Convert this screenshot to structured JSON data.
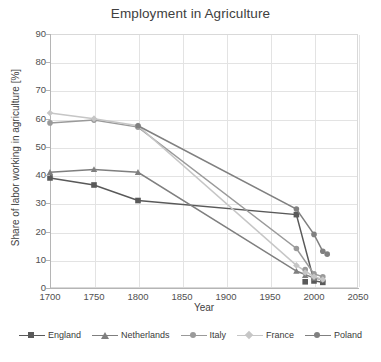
{
  "chart_data": {
    "type": "line",
    "title": "Employment in Agriculture",
    "xlabel": "Year",
    "ylabel": "Share of labor working in agriculture [%]",
    "xlim": [
      1700,
      2050
    ],
    "ylim": [
      0,
      90
    ],
    "xticks": [
      1700,
      1750,
      1800,
      1850,
      1900,
      1950,
      2000,
      2050
    ],
    "yticks": [
      0,
      10,
      20,
      30,
      40,
      50,
      60,
      70,
      80,
      90
    ],
    "grid": true,
    "legend_position": "bottom",
    "series": [
      {
        "name": "England",
        "color": "#595959",
        "marker": "square",
        "points": [
          {
            "x": 1700,
            "y": 39
          },
          {
            "x": 1750,
            "y": 36.5
          },
          {
            "x": 1800,
            "y": 31
          },
          {
            "x": 1980,
            "y": 26
          },
          {
            "x": 2000,
            "y": 2.5
          },
          {
            "x": 2010,
            "y": 2
          }
        ]
      },
      {
        "name": "Netherlands",
        "color": "#7f7f7f",
        "marker": "triangle",
        "points": [
          {
            "x": 1700,
            "y": 41
          },
          {
            "x": 1750,
            "y": 42
          },
          {
            "x": 1800,
            "y": 41
          },
          {
            "x": 1980,
            "y": 6
          },
          {
            "x": 2000,
            "y": 3.5
          },
          {
            "x": 2010,
            "y": 3
          }
        ]
      },
      {
        "name": "Italy",
        "color": "#9a9a9a",
        "marker": "circle",
        "points": [
          {
            "x": 1700,
            "y": 58.5
          },
          {
            "x": 1750,
            "y": 59.5
          },
          {
            "x": 1800,
            "y": 57
          },
          {
            "x": 1980,
            "y": 14
          },
          {
            "x": 2000,
            "y": 5
          },
          {
            "x": 2010,
            "y": 4
          }
        ]
      },
      {
        "name": "France",
        "color": "#c6c6c6",
        "marker": "diamond",
        "points": [
          {
            "x": 1700,
            "y": 62
          },
          {
            "x": 1750,
            "y": 60
          },
          {
            "x": 1800,
            "y": 57.5
          },
          {
            "x": 1980,
            "y": 8
          },
          {
            "x": 2000,
            "y": 4
          },
          {
            "x": 2010,
            "y": 3
          }
        ]
      },
      {
        "name": "Poland",
        "color": "#808080",
        "marker": "circle",
        "points": [
          {
            "x": 1800,
            "y": 57.5
          },
          {
            "x": 1980,
            "y": 28
          },
          {
            "x": 2000,
            "y": 19
          },
          {
            "x": 2010,
            "y": 13
          }
        ]
      }
    ],
    "extra_points": [
      {
        "series": "England",
        "x": 1990,
        "y": 2.2
      },
      {
        "series": "Netherlands",
        "x": 1990,
        "y": 4.5
      },
      {
        "series": "Italy",
        "x": 1990,
        "y": 6.5
      },
      {
        "series": "France",
        "x": 1990,
        "y": 5.5
      },
      {
        "series": "Poland",
        "x": 2015,
        "y": 12
      }
    ]
  }
}
